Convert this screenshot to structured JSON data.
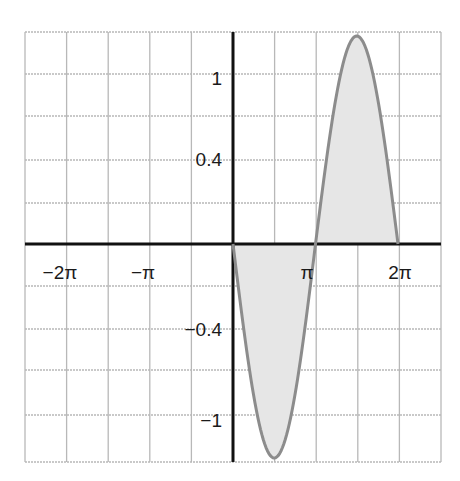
{
  "chart_data": {
    "type": "area",
    "title": "",
    "xlabel": "",
    "ylabel": "",
    "function_shape": "sine-like single period, negative lobe on (0, pi), positive lobe on (pi, 2pi), zero elsewhere",
    "x": [
      0,
      0.785,
      1.571,
      2.356,
      3.142,
      3.927,
      4.712,
      5.498,
      6.283
    ],
    "x_labels_readable": [
      "0",
      "π/4",
      "π/2",
      "3π/4",
      "π",
      "5π/4",
      "3π/2",
      "7π/4",
      "2π"
    ],
    "series": [
      {
        "name": "f(x)",
        "values": [
          0,
          -0.87,
          -1.26,
          -0.87,
          0,
          0.87,
          1.22,
          0.87,
          0
        ],
        "fill": "shaded area between curve and x-axis"
      }
    ],
    "xlim": [
      -7.85,
      7.85
    ],
    "ylim": [
      -1.26,
      1.26
    ],
    "x_tick_labels": [
      "−2π",
      "−π",
      "π",
      "2π"
    ],
    "x_tick_values": [
      -6.283,
      -3.142,
      3.142,
      6.283
    ],
    "y_tick_labels": [
      "1",
      "0.4",
      "−0.4",
      "−1"
    ],
    "grid": true,
    "grid_columns": 10,
    "grid_rows": 10,
    "legend": null,
    "colors": {
      "curve": "#8c8c8c",
      "fill": "#e6e6e6",
      "axis": "#111111",
      "grid": "#b8b8b8"
    }
  },
  "labels": {
    "x": [
      "−2π",
      "−π",
      "π",
      "2π"
    ],
    "y": [
      "1",
      "0.4",
      "−0.4",
      "−1"
    ]
  }
}
